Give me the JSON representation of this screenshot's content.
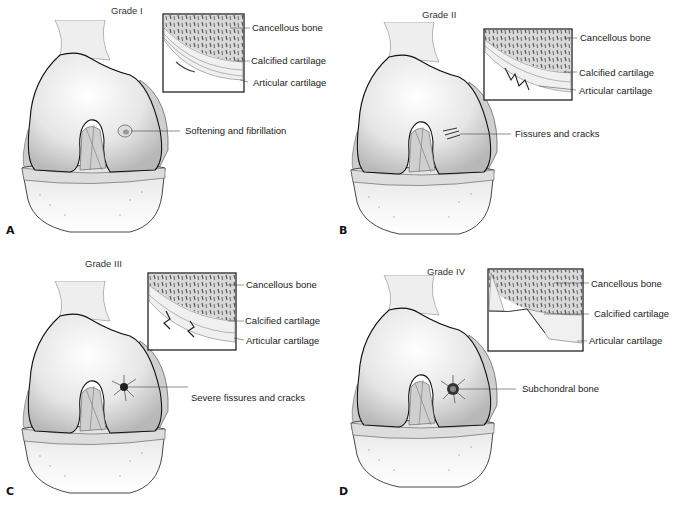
{
  "figure": {
    "panels": [
      {
        "letter": "A",
        "grade": "Grade I",
        "lesion_label": "Softening and fibrillation",
        "inset_labels": {
          "cancellous": "Cancellous bone",
          "calcified": "Calcified cartilage",
          "articular": "Articular cartilage"
        }
      },
      {
        "letter": "B",
        "grade": "Grade II",
        "lesion_label": "Fissures and cracks",
        "inset_labels": {
          "cancellous": "Cancellous bone",
          "calcified": "Calcified cartilage",
          "articular": "Articular cartilage"
        }
      },
      {
        "letter": "C",
        "grade": "Grade III",
        "lesion_label": "Severe fissures and cracks",
        "inset_labels": {
          "cancellous": "Cancellous bone",
          "calcified": "Calcified cartilage",
          "articular": "Articular cartilage"
        }
      },
      {
        "letter": "D",
        "grade": "Grade IV",
        "lesion_label": "Subchondral bone",
        "inset_labels": {
          "cancellous": "Cancellous bone",
          "calcified": "Calcified cartilage",
          "articular": "Articular cartilage"
        }
      }
    ]
  }
}
